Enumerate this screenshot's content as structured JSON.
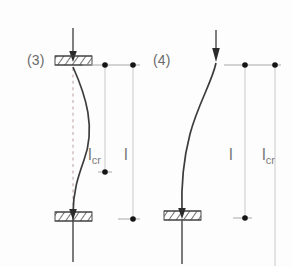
{
  "figure": {
    "case_left": {
      "case_label": "(3)",
      "support_top": "fixed-hatched-support",
      "support_bottom": "fixed-hatched-support",
      "load_arrow": "downward-load-arrow",
      "buckled_shape": "s-curve",
      "dimensions": [
        {
          "name": "effective-length",
          "base": "l",
          "sub": "cr"
        },
        {
          "name": "actual-length",
          "base": "l",
          "sub": ""
        }
      ]
    },
    "case_right": {
      "case_label": "(4)",
      "support_top": "free-end",
      "support_bottom": "fixed-hatched-support",
      "load_arrow": "downward-load-arrow",
      "buckled_shape": "cantilever-curve",
      "dimensions": [
        {
          "name": "actual-length",
          "base": "l",
          "sub": ""
        },
        {
          "name": "effective-length",
          "base": "l",
          "sub": "cr"
        }
      ]
    }
  },
  "colors": {
    "column_line": "#4a4a4a",
    "curve": "#3c3c3c",
    "dimension_line": "#b9b9b9",
    "marker": "#1a1a1a",
    "hatch": "#555555",
    "label_text": "#6a6a6a",
    "dashed_axis": "#c2a9a9",
    "background": "#fdfdfd"
  }
}
